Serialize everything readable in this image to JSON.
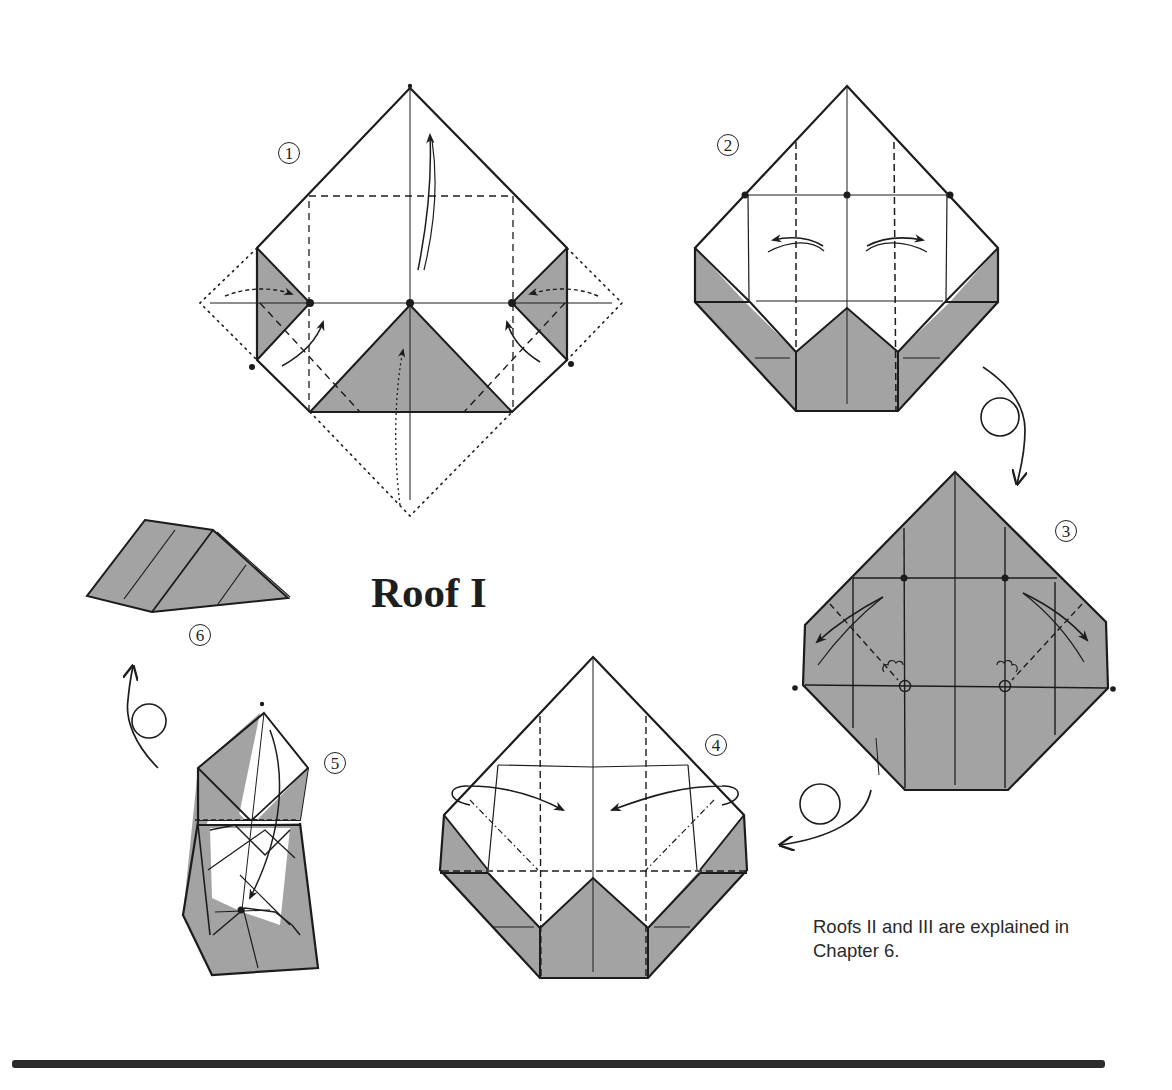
{
  "page": {
    "title": "Roof I",
    "note": "Roofs II and III are explained in Chapter 6."
  },
  "steps": [
    {
      "id": 1,
      "label": "①",
      "description": "Fold corners to center along valley lines; dotted outlines show original square"
    },
    {
      "id": 2,
      "label": "②",
      "description": "Unfold side flaps outward"
    },
    {
      "id": 3,
      "label": "③",
      "description": "Turn over; fold corners diagonally"
    },
    {
      "id": 4,
      "label": "④",
      "description": "Fold sides inward"
    },
    {
      "id": 5,
      "label": "⑤",
      "description": "Fold top down into pocket"
    },
    {
      "id": 6,
      "label": "⑥",
      "description": "Finished roof"
    }
  ],
  "symbols": {
    "turn_over_icon_count": 3,
    "shade_color": "#a3a3a3",
    "line_color": "#1c1c1c"
  }
}
